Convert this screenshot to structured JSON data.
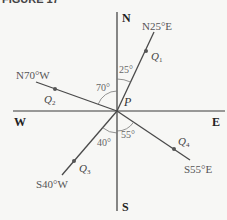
{
  "caption": "FIGURE 17",
  "compass": {
    "north": "N",
    "south": "S",
    "east": "E",
    "west": "W"
  },
  "center": {
    "label": "P"
  },
  "bearings": [
    {
      "id": "q1",
      "label": "N25°E",
      "point": "Q",
      "sub": "1",
      "angle_label": "25°"
    },
    {
      "id": "q2",
      "label": "N70°W",
      "point": "Q",
      "sub": "2",
      "angle_label": "70°"
    },
    {
      "id": "q3",
      "label": "S40°W",
      "point": "Q",
      "sub": "3",
      "angle_label": "40°"
    },
    {
      "id": "q4",
      "label": "S55°E",
      "point": "Q",
      "sub": "4",
      "angle_label": "55°"
    }
  ],
  "colors": {
    "axis": "#3a3a3a",
    "bearing_line": "#4a4a4a",
    "point": "#555555",
    "text": "#333333",
    "angle_text": "#666666",
    "background": "#f7f7f5"
  }
}
